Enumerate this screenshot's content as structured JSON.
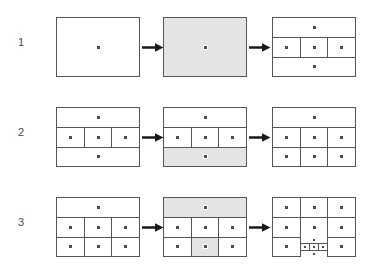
{
  "figure": {
    "title": "",
    "caption": "",
    "rows": [
      {
        "label": "1",
        "panels": [
          {
            "name": "row1-panel-initial",
            "description": "single undivided cell with one point",
            "shaded": false,
            "layout": "single",
            "point_count": 1
          },
          {
            "name": "row1-panel-selected",
            "description": "the whole cell highlighted for splitting",
            "shaded": true,
            "layout": "single",
            "point_count": 1
          },
          {
            "name": "row1-panel-result",
            "description": "cell split into three horizontal bands, middle band split into three columns",
            "shaded": false,
            "layout": "three-bands-middle-split-3",
            "point_count": 5
          }
        ],
        "arrows": [
          "arrow-right",
          "arrow-right"
        ]
      },
      {
        "label": "2",
        "panels": [
          {
            "name": "row2-panel-initial",
            "description": "three horizontal bands, middle band split into three columns",
            "shaded": false,
            "layout": "three-bands-middle-split-3",
            "point_count": 5
          },
          {
            "name": "row2-panel-selected",
            "description": "bottom band highlighted for splitting",
            "shaded": false,
            "layout": "three-bands-middle-split-3",
            "shaded_region": "bottom-band",
            "point_count": 5
          },
          {
            "name": "row2-panel-result",
            "description": "top band plus a two-by-three grid below",
            "shaded": false,
            "layout": "top-band-plus-2x3",
            "point_count": 7
          }
        ],
        "arrows": [
          "arrow-right",
          "arrow-right"
        ]
      },
      {
        "label": "3",
        "panels": [
          {
            "name": "row3-panel-initial",
            "description": "top band plus a two-by-three grid below",
            "shaded": false,
            "layout": "top-band-plus-2x3",
            "point_count": 7
          },
          {
            "name": "row3-panel-selected",
            "description": "top band and bottom middle cell highlighted",
            "shaded": false,
            "layout": "top-band-plus-2x3",
            "shaded_region": "top-band-and-bottom-middle-cell",
            "point_count": 7
          },
          {
            "name": "row3-panel-result",
            "description": "three by three grid with the bottom middle cell recursively subdivided",
            "shaded": false,
            "layout": "3x3-with-nested-split",
            "point_count": 13
          }
        ],
        "arrows": [
          "arrow-right",
          "arrow-right"
        ]
      }
    ]
  },
  "style": {
    "line_color": "#555555",
    "shade_color": "#e4e4e4",
    "point_color": "#4d4d4d",
    "background": "#ffffff",
    "arrow_color": "#1a1a1a"
  },
  "icons": {
    "arrow": "arrow-right-icon",
    "point": "point-marker-icon"
  }
}
